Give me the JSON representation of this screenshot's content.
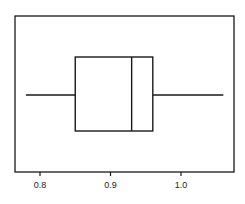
{
  "chart_data": {
    "type": "boxplot",
    "orientation": "horizontal",
    "title": "",
    "xlabel": "",
    "ylabel": "",
    "xlim": [
      0.765,
      1.075
    ],
    "xticks": [
      0.8,
      0.9,
      1.0
    ],
    "xtick_labels": [
      "0.8",
      "0.9",
      "1.0"
    ],
    "grid": false,
    "legend": null,
    "series": [
      {
        "name": "",
        "min": 0.78,
        "q1": 0.85,
        "median": 0.93,
        "q3": 0.96,
        "max": 1.06
      }
    ]
  },
  "axis": {
    "ticks": [
      {
        "label": "0.8"
      },
      {
        "label": "0.9"
      },
      {
        "label": "1.0"
      }
    ]
  },
  "colors": {
    "line": "#1a1a1a",
    "background": "#ffffff"
  }
}
